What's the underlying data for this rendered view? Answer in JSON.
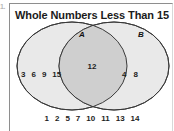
{
  "item_number": "1.",
  "panel": {
    "title": "Whole Numbers Less Than 15"
  },
  "venn": {
    "set_a_label": "A",
    "set_b_label": "B",
    "set_a_only": [
      "3",
      "6",
      "9",
      "15"
    ],
    "intersection": [
      "12"
    ],
    "set_b_only": [
      "4",
      "8"
    ],
    "outside": [
      "1",
      "2",
      "5",
      "7",
      "10",
      "11",
      "13",
      "14"
    ],
    "colors": {
      "circle_fill": "#e9e9e9",
      "intersection_fill": "#cfcfcf",
      "circle_stroke": "#3a3a3a",
      "text": "#1d1d1d"
    }
  },
  "chart_data": {
    "type": "venn",
    "title": "Whole Numbers Less Than 15",
    "sets": [
      {
        "name": "A",
        "only": [
          "3",
          "6",
          "9",
          "15"
        ]
      },
      {
        "name": "B",
        "only": [
          "4",
          "8"
        ]
      }
    ],
    "intersection": [
      "12"
    ],
    "outside_universe": [
      "1",
      "2",
      "5",
      "7",
      "10",
      "11",
      "13",
      "14"
    ],
    "universe_label": "Whole Numbers Less Than 15"
  }
}
